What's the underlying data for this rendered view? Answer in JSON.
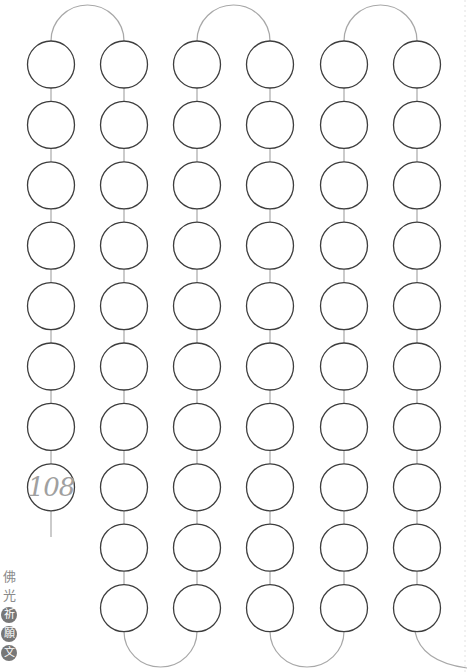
{
  "sheet": {
    "name": "108-bead mala counting chart",
    "total_beads": 108,
    "final_bead_label": "108",
    "colors": {
      "bead_stroke": "#3d3d3d",
      "connector": "#a8a8a8",
      "number_text": "#a0a0a0",
      "title_text": "#8a8a8a",
      "title_badge": "#777777"
    }
  },
  "title": {
    "characters": [
      {
        "char": "佛",
        "style": "plain"
      },
      {
        "char": "光",
        "style": "plain"
      },
      {
        "char": "祈",
        "style": "boxed"
      },
      {
        "char": "願",
        "style": "boxed"
      },
      {
        "char": "文",
        "style": "boxed"
      }
    ]
  },
  "layout": {
    "bead_radius": 23.5,
    "columns": [
      {
        "x": 51,
        "rows": 8,
        "label_last": true
      },
      {
        "x": 124,
        "rows": 10
      },
      {
        "x": 197,
        "rows": 10
      },
      {
        "x": 270,
        "rows": 10
      },
      {
        "x": 344,
        "rows": 10
      },
      {
        "x": 417,
        "rows": 10
      }
    ],
    "first_row_y": 64.5,
    "row_spacing": 60.4,
    "top_arc_peak_y": 5,
    "bottom_arc_low_y": 667,
    "tail_end_y": 537
  }
}
